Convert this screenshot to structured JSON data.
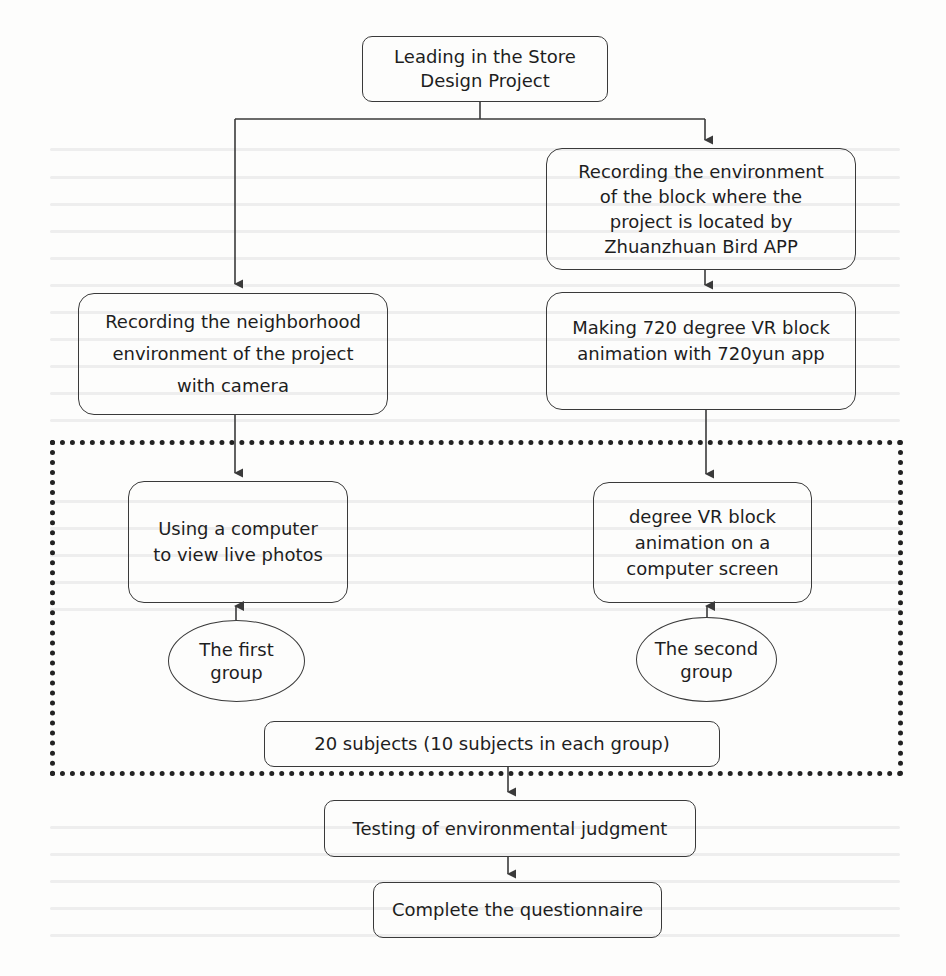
{
  "diagram": {
    "type": "flowchart",
    "nodes": {
      "start": {
        "label": "Leading in the Store\nDesign Project"
      },
      "record_block": {
        "label": "Recording the environment\nof the block where the\nproject is located by\nZhuanzhuan Bird APP"
      },
      "record_neighborhood": {
        "label": "Recording the neighborhood\nenvironment  of the project\nwith camera"
      },
      "make_vr": {
        "label": "Making 720 degree VR block\nanimation with 720yun app"
      },
      "view_photos": {
        "label": "Using a computer\nto view live photos"
      },
      "view_vr": {
        "label": "degree VR block\nanimation on a\ncomputer screen"
      },
      "group_one": {
        "label": "The first\ngroup"
      },
      "group_two": {
        "label": "The second\ngroup"
      },
      "subjects": {
        "label": "20 subjects (10 subjects in each group)"
      },
      "testing": {
        "label": "Testing of environmental judgment"
      },
      "questionnaire": {
        "label": "Complete the questionnaire"
      }
    },
    "edges": [
      {
        "from": "start",
        "to": "record_neighborhood"
      },
      {
        "from": "start",
        "to": "record_block"
      },
      {
        "from": "record_block",
        "to": "make_vr"
      },
      {
        "from": "record_neighborhood",
        "to": "view_photos"
      },
      {
        "from": "make_vr",
        "to": "view_vr"
      },
      {
        "from": "group_one",
        "to": "view_photos"
      },
      {
        "from": "group_two",
        "to": "view_vr"
      },
      {
        "from": "subjects",
        "to": "testing"
      },
      {
        "from": "testing",
        "to": "questionnaire"
      }
    ],
    "colors": {
      "stroke": "#3a3a3a",
      "text": "#1e1e1e",
      "dotted_border": "#222222",
      "background": "#fdfdfc"
    }
  }
}
